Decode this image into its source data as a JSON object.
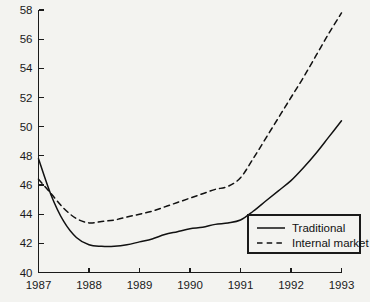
{
  "chart_data": {
    "type": "line",
    "title": "",
    "subtitle": "",
    "xlabel": "",
    "ylabel": "",
    "xlim": [
      1987,
      1993
    ],
    "ylim": [
      40,
      58
    ],
    "grid": false,
    "legend_position": "bottom-right",
    "x_ticks": [
      "1987",
      "1988",
      "1989",
      "1990",
      "1991",
      "1992",
      "1993"
    ],
    "y_ticks": [
      "40",
      "42",
      "44",
      "46",
      "48",
      "50",
      "52",
      "54",
      "56",
      "58"
    ],
    "x": [
      1987,
      1987.25,
      1987.5,
      1987.75,
      1988,
      1988.25,
      1988.5,
      1988.75,
      1989,
      1989.25,
      1989.5,
      1989.75,
      1990,
      1990.25,
      1990.5,
      1990.75,
      1991,
      1991.25,
      1991.5,
      1991.75,
      1992,
      1992.25,
      1992.5,
      1992.75,
      1993
    ],
    "series": [
      {
        "name": "Traditional",
        "style": "solid",
        "color": "#111111",
        "values": [
          47.8,
          45.3,
          43.5,
          42.4,
          41.9,
          41.8,
          41.8,
          41.9,
          42.1,
          42.3,
          42.6,
          42.8,
          43.0,
          43.1,
          43.3,
          43.4,
          43.6,
          44.2,
          44.9,
          45.6,
          46.3,
          47.2,
          48.2,
          49.3,
          50.4
        ]
      },
      {
        "name": "Internal market",
        "style": "dashed",
        "color": "#111111",
        "values": [
          46.4,
          45.4,
          44.4,
          43.7,
          43.4,
          43.5,
          43.6,
          43.8,
          44.0,
          44.2,
          44.5,
          44.8,
          45.1,
          45.4,
          45.7,
          45.9,
          46.5,
          47.8,
          49.2,
          50.6,
          52.0,
          53.4,
          54.9,
          56.4,
          57.8
        ]
      }
    ],
    "legend": [
      {
        "label": "Traditional",
        "style": "solid"
      },
      {
        "label": "Internal market",
        "style": "dashed"
      }
    ]
  }
}
